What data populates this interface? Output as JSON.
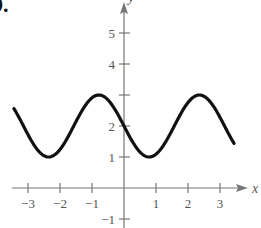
{
  "problem_label": "9.",
  "chart_data": {
    "type": "line",
    "title": "",
    "xlabel": "x",
    "ylabel": "y",
    "function": "y = 2 - sin(2x)",
    "xlim": [
      -3.45,
      3.45
    ],
    "ylim": [
      -1,
      5
    ],
    "grid": false,
    "legend": "none",
    "x_ticks": [
      -3,
      -2,
      -1,
      1,
      2,
      3
    ],
    "x_tick_labels": [
      "−3",
      "−2",
      "−1",
      "1",
      "2",
      "3"
    ],
    "y_ticks": [
      -1,
      1,
      2,
      3,
      4,
      5
    ],
    "y_tick_labels": [
      "−1",
      "1",
      "2",
      "",
      "4",
      "5"
    ],
    "series": [
      {
        "name": "curve",
        "color": "#111111",
        "x": [
          -3.44,
          -3.0,
          -2.5,
          -2.36,
          -2.0,
          -1.5,
          -1.0,
          -0.79,
          -0.5,
          0.0,
          0.5,
          0.79,
          1.0,
          1.5,
          2.0,
          2.36,
          2.5,
          3.0,
          3.44
        ],
        "y": [
          2.56,
          2.28,
          1.04,
          1.0,
          1.24,
          1.86,
          2.91,
          3.0,
          2.84,
          2.0,
          1.16,
          1.0,
          1.09,
          1.86,
          2.76,
          3.0,
          2.96,
          2.28,
          1.45
        ]
      }
    ],
    "colors": {
      "axis": "#777777",
      "curve": "#111111",
      "text": "#555555"
    }
  }
}
